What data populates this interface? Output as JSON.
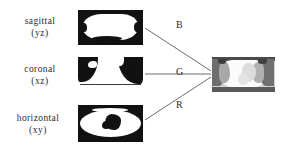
{
  "figure": {
    "background_color": "#ffffff",
    "line_color": "#6d6d6d",
    "text_color": "#2b2b2b"
  },
  "views": [
    {
      "name": "sagittal",
      "label": "sagittal",
      "axes": "(yz)",
      "channel": "B",
      "channel_name": "blue"
    },
    {
      "name": "coronal",
      "label": "coronal",
      "axes": "(xz)",
      "channel": "G",
      "channel_name": "green"
    },
    {
      "name": "horizontal",
      "label": "horizontal",
      "axes": "(xy)",
      "channel": "R",
      "channel_name": "red"
    }
  ],
  "channels": {
    "blue_label": "B",
    "green_label": "G",
    "red_label": "R"
  },
  "composite": {
    "name": "composite-image"
  }
}
